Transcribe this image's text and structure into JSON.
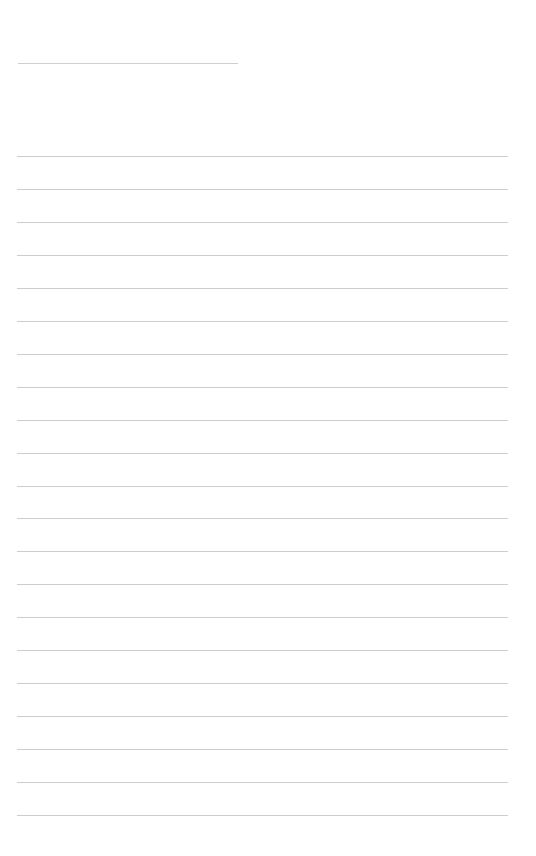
{
  "page": {
    "type": "blank lined sheet",
    "title_line": {
      "x": 18,
      "y": 63,
      "width": 220
    },
    "ruled_lines": {
      "count": 21,
      "start_y": 156,
      "spacing": 32.95,
      "x": 17,
      "width": 491,
      "color": "#cdcdcd"
    },
    "background_color": "#ffffff"
  }
}
